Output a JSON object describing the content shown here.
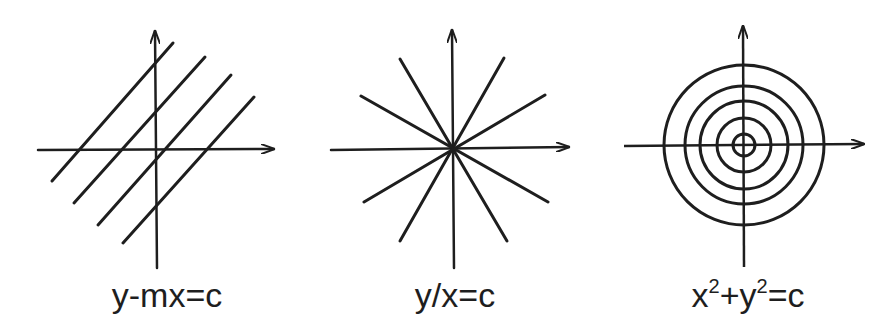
{
  "figure": {
    "panels": [
      {
        "id": "parallel-lines",
        "label": "y-mx=c",
        "description": "family of parallel lines with slope m"
      },
      {
        "id": "radial-lines",
        "label": "y/x=c",
        "description": "family of lines through origin"
      },
      {
        "id": "concentric-circles",
        "label_base_x": "x",
        "label_exp_x": "2",
        "label_plus": "+",
        "label_base_y": "y",
        "label_exp_y": "2",
        "label_rest": "=c",
        "description": "family of concentric circles centered at origin"
      }
    ],
    "colors": {
      "stroke": "#1e1e1e",
      "background": "#ffffff"
    }
  }
}
